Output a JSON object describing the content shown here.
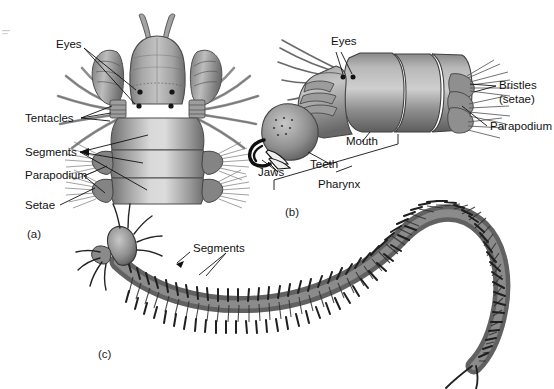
{
  "figure": {
    "kind": "scientific-illustration",
    "background_color": "#ffffff",
    "ink_color": "#111111",
    "body_gray_light": "#cfcfcf",
    "body_gray_mid": "#9a9a9a",
    "body_gray_dark": "#5b5b5b",
    "body_gray_darkest": "#2f2f2f"
  },
  "panels": [
    {
      "id": "a",
      "id_label": "(a)",
      "view": "dorsal-head-and-anterior-segments",
      "labels": [
        {
          "name": "eyes",
          "text": "Eyes"
        },
        {
          "name": "tentacles",
          "text": "Tentacles"
        },
        {
          "name": "segments",
          "text": "Segments"
        },
        {
          "name": "parapodium",
          "text": "Parapodium"
        },
        {
          "name": "setae",
          "text": "Setae"
        }
      ]
    },
    {
      "id": "b",
      "id_label": "(b)",
      "view": "lateral-head-with-everted-pharynx",
      "labels": [
        {
          "name": "eyes",
          "text": "Eyes"
        },
        {
          "name": "bristles",
          "text": "Bristles"
        },
        {
          "name": "bristles-setae",
          "text": "(setae)"
        },
        {
          "name": "parapodium",
          "text": "Parapodium"
        },
        {
          "name": "mouth",
          "text": "Mouth"
        },
        {
          "name": "teeth",
          "text": "Teeth"
        },
        {
          "name": "jaws",
          "text": "Jaws"
        },
        {
          "name": "pharynx",
          "text": "Pharynx"
        }
      ]
    },
    {
      "id": "c",
      "id_label": "(c)",
      "view": "whole-body-curved",
      "labels": [
        {
          "name": "segments",
          "text": "Segments"
        }
      ]
    }
  ],
  "labels": {
    "a_eyes": "Eyes",
    "a_tentacles": "Tentacles",
    "a_segments": "Segments",
    "a_parapodium": "Parapodium",
    "a_setae": "Setae",
    "a_panel": "(a)",
    "b_eyes": "Eyes",
    "b_bristles": "Bristles",
    "b_setae": "(setae)",
    "b_parapodium": "Parapodium",
    "b_mouth": "Mouth",
    "b_teeth": "Teeth",
    "b_jaws": "Jaws",
    "b_pharynx": "Pharynx",
    "b_panel": "(b)",
    "c_segments": "Segments",
    "c_panel": "(c)"
  }
}
